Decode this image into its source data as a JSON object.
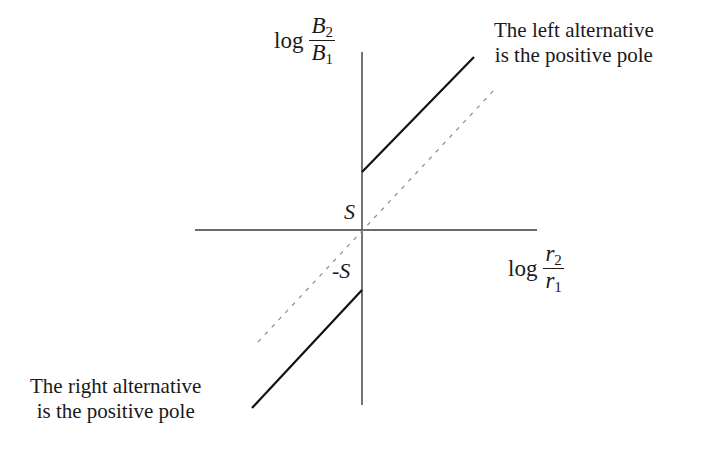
{
  "y_axis_label": {
    "prefix": "log",
    "numerator_var": "B",
    "numerator_sub": "2",
    "denominator_var": "B",
    "denominator_sub": "1"
  },
  "x_axis_label": {
    "prefix": "log",
    "numerator_var": "r",
    "numerator_sub": "2",
    "denominator_var": "r",
    "denominator_sub": "1"
  },
  "intercepts": {
    "upper": "S",
    "lower": "-S"
  },
  "annotations": {
    "upper_right": [
      "The left alternative",
      "is the positive pole"
    ],
    "lower_left": [
      "The right alternative",
      "is the positive pole"
    ]
  },
  "geometry": {
    "origin": [
      362,
      230
    ],
    "y_axis": {
      "x": 362,
      "y1": 52,
      "y2": 405
    },
    "x_axis": {
      "y": 230,
      "x1": 195,
      "x2": 537
    },
    "upper_line": {
      "x1": 362,
      "y1": 172,
      "x2": 474,
      "y2": 57
    },
    "lower_line": {
      "x1": 362,
      "y1": 290,
      "x2": 252,
      "y2": 408
    },
    "dashed_line": {
      "x1": 258,
      "y1": 342,
      "x2": 495,
      "y2": 89
    }
  },
  "colors": {
    "axis": "#3a3a3a",
    "solid_line": "#111111",
    "dashed_line": "#8a8a8a",
    "text": "#1a1a1a"
  }
}
